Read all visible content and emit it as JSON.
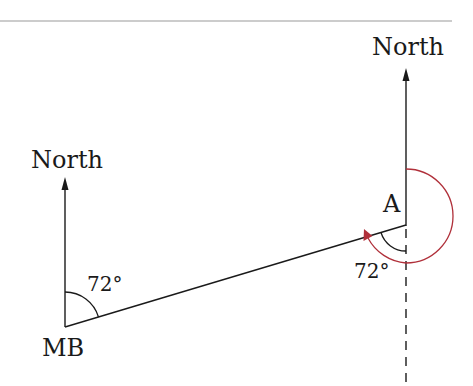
{
  "diagram": {
    "type": "bearing-diagram",
    "colors": {
      "line": "#1a1a1a",
      "rule": "#9a9a9a",
      "bearing_arc": "#b0303a"
    },
    "points": {
      "mb": {
        "label": "MB"
      },
      "a": {
        "label": "A"
      }
    },
    "north_labels": {
      "left": "North",
      "right": "North"
    },
    "angles": {
      "at_mb": "72°",
      "at_a": "72°"
    }
  }
}
